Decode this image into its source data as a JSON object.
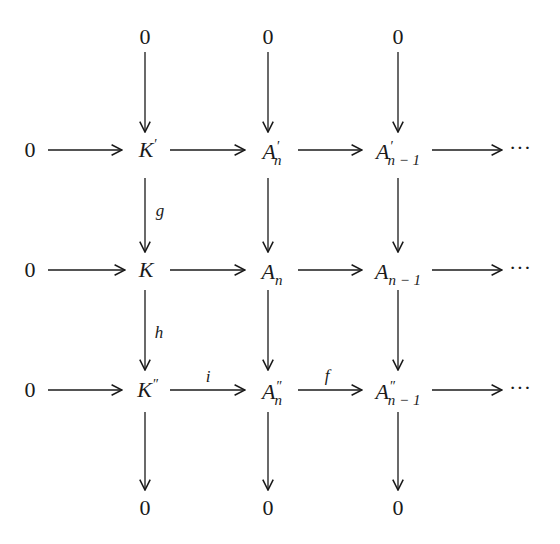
{
  "diagram": {
    "type": "commutative-diagram",
    "top_zeros": [
      "0",
      "0",
      "0"
    ],
    "bottom_zeros": [
      "0",
      "0",
      "0"
    ],
    "rows": [
      {
        "left": "0",
        "nodes": [
          {
            "base": "K",
            "sup": "′",
            "sub": ""
          },
          {
            "base": "A",
            "sup": "′",
            "sub": "n"
          },
          {
            "base": "A",
            "sup": "′",
            "sub": "n − 1"
          }
        ],
        "tail": "···"
      },
      {
        "left": "0",
        "nodes": [
          {
            "base": "K",
            "sup": "",
            "sub": ""
          },
          {
            "base": "A",
            "sup": "",
            "sub": "n"
          },
          {
            "base": "A",
            "sup": "",
            "sub": "n − 1"
          }
        ],
        "tail": "···"
      },
      {
        "left": "0",
        "nodes": [
          {
            "base": "K",
            "sup": "″",
            "sub": ""
          },
          {
            "base": "A",
            "sup": "″",
            "sub": "n"
          },
          {
            "base": "A",
            "sup": "″",
            "sub": "n − 1"
          }
        ],
        "tail": "···"
      }
    ],
    "labels": {
      "g": "g",
      "h": "h",
      "i": "i",
      "f": "f"
    }
  }
}
